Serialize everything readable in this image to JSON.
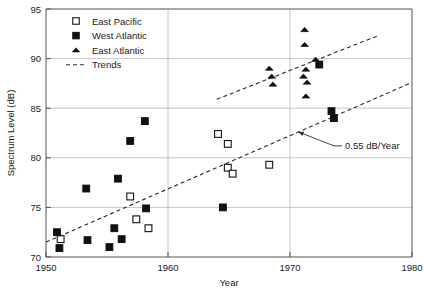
{
  "chart_data": {
    "type": "scatter",
    "title": "",
    "xlabel": "Year",
    "ylabel": "Spectrum Level (dB)",
    "xlim": [
      1950,
      1980
    ],
    "ylim": [
      70,
      95
    ],
    "xticks": [
      1950,
      1960,
      1970,
      1980
    ],
    "yticks": [
      70,
      75,
      80,
      85,
      90,
      95
    ],
    "xtick_labels": [
      "1950",
      "1960",
      "1970",
      "1980"
    ],
    "ytick_labels": [
      "70",
      "75",
      "80",
      "85",
      "90",
      "95"
    ],
    "grid": "horizontal-and-vertical",
    "legend_position": "top-left-inside",
    "series": [
      {
        "name": "East Pacific",
        "marker": "open-square",
        "color": "#ffffff",
        "edge_color": "#111111",
        "points": [
          {
            "x": 1951.2,
            "y": 71.8
          },
          {
            "x": 1956.9,
            "y": 76.1
          },
          {
            "x": 1957.4,
            "y": 73.8
          },
          {
            "x": 1958.4,
            "y": 72.9
          },
          {
            "x": 1964.1,
            "y": 82.4
          },
          {
            "x": 1964.9,
            "y": 81.4
          },
          {
            "x": 1964.9,
            "y": 79.0
          },
          {
            "x": 1965.3,
            "y": 78.4
          },
          {
            "x": 1968.3,
            "y": 79.3
          }
        ]
      },
      {
        "name": "West Atlantic",
        "marker": "filled-square",
        "color": "#111111",
        "edge_color": "#111111",
        "points": [
          {
            "x": 1950.9,
            "y": 72.5
          },
          {
            "x": 1951.1,
            "y": 70.9
          },
          {
            "x": 1953.3,
            "y": 76.9
          },
          {
            "x": 1953.4,
            "y": 71.7
          },
          {
            "x": 1955.2,
            "y": 71.0
          },
          {
            "x": 1955.6,
            "y": 72.9
          },
          {
            "x": 1955.9,
            "y": 77.9
          },
          {
            "x": 1956.2,
            "y": 71.8
          },
          {
            "x": 1956.9,
            "y": 81.7
          },
          {
            "x": 1958.1,
            "y": 83.7
          },
          {
            "x": 1958.2,
            "y": 74.9
          },
          {
            "x": 1964.5,
            "y": 75.0
          },
          {
            "x": 1972.4,
            "y": 89.4
          },
          {
            "x": 1973.4,
            "y": 84.7
          },
          {
            "x": 1973.6,
            "y": 84.0
          }
        ]
      },
      {
        "name": "East Atlantic",
        "marker": "filled-triangle",
        "color": "#111111",
        "edge_color": "#111111",
        "points": [
          {
            "x": 1968.3,
            "y": 89.0
          },
          {
            "x": 1968.5,
            "y": 88.2
          },
          {
            "x": 1968.6,
            "y": 87.4
          },
          {
            "x": 1971.2,
            "y": 92.9
          },
          {
            "x": 1971.2,
            "y": 91.4
          },
          {
            "x": 1971.3,
            "y": 88.9
          },
          {
            "x": 1971.1,
            "y": 88.2
          },
          {
            "x": 1971.4,
            "y": 87.6
          },
          {
            "x": 1971.3,
            "y": 86.2
          },
          {
            "x": 1972.1,
            "y": 89.9
          }
        ]
      }
    ],
    "trends": [
      {
        "name": "Lower trend",
        "style": "dashed",
        "x_start": 1950.0,
        "y_start": 71.5,
        "x_end": 1980.0,
        "y_end": 87.6
      },
      {
        "name": "Upper trend",
        "style": "dashed",
        "x_start": 1964.0,
        "y_start": 85.9,
        "x_end": 1977.2,
        "y_end": 92.3
      }
    ],
    "annotations": [
      {
        "text": "0.55 dB/Year",
        "target_x": 1970.7,
        "target_y": 82.6,
        "label_x": 1974.1,
        "label_y": 81.3
      }
    ]
  },
  "legend": {
    "items": [
      {
        "label": "East Pacific",
        "marker": "open-square"
      },
      {
        "label": "West Atlantic",
        "marker": "filled-square"
      },
      {
        "label": "East Atlantic",
        "marker": "filled-triangle"
      },
      {
        "label": "Trends",
        "marker": "dashed-line"
      }
    ]
  }
}
